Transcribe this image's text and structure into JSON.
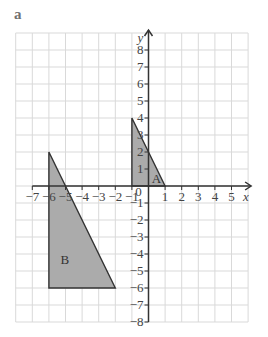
{
  "part_label": "a",
  "axes": {
    "x_name": "x",
    "y_name": "y",
    "origin_label": "0",
    "x_min": -8,
    "x_max": 6,
    "y_min": -8,
    "y_max": 9,
    "x_tick_labels": [
      -7,
      -6,
      -5,
      -4,
      -3,
      -2,
      -1,
      1,
      2,
      3,
      4,
      5
    ],
    "y_tick_labels": [
      8,
      7,
      6,
      5,
      4,
      3,
      2,
      1,
      -1,
      -2,
      -3,
      -4,
      -5,
      -6,
      -7,
      -8
    ]
  },
  "shapes": [
    {
      "label": "A",
      "vertices": [
        [
          -1,
          4
        ],
        [
          -1,
          0
        ],
        [
          1,
          0
        ]
      ],
      "label_pos": [
        0.2,
        0.45
      ]
    },
    {
      "label": "B",
      "vertices": [
        [
          -6,
          2
        ],
        [
          -6,
          -6
        ],
        [
          -2,
          -6
        ]
      ],
      "label_pos": [
        -5.3,
        -4.3
      ]
    }
  ],
  "colors": {
    "grid": "#d9d9d9",
    "axis": "#333333",
    "shape_fill": "#ababab",
    "shape_stroke": "#333333"
  }
}
